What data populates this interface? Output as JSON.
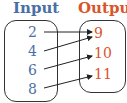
{
  "headers": {
    "input": "Input",
    "output": "Output"
  },
  "inputs": [
    "2",
    "4",
    "6",
    "8"
  ],
  "outputs": [
    "9",
    "10",
    "11"
  ],
  "mappings": [
    {
      "from": "2",
      "to": "9"
    },
    {
      "from": "4",
      "to": "9"
    },
    {
      "from": "6",
      "to": "10"
    },
    {
      "from": "8",
      "to": "11"
    }
  ],
  "colors": {
    "input": "#4a6fa5",
    "output": "#d9542b",
    "arrow": "#222222"
  }
}
